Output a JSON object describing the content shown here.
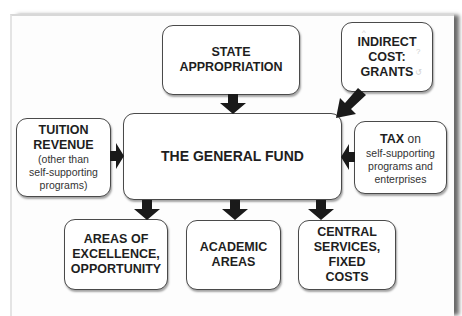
{
  "diagram": {
    "center": {
      "label": "THE GENERAL FUND"
    },
    "inputs": [
      {
        "id": "state",
        "lines": [
          "STATE",
          "APPROPRIATION"
        ]
      },
      {
        "id": "indirect",
        "lines": [
          "INDIRECT",
          "COST:",
          "GRANTS"
        ]
      },
      {
        "id": "tuition",
        "title_lines": [
          "TUITION",
          "REVENUE"
        ],
        "note_lines": [
          "(other than",
          "self-supporting",
          "programs)"
        ]
      },
      {
        "id": "tax",
        "title": "TAX",
        "title_suffix": " on",
        "note_lines": [
          "self-supporting",
          "programs and",
          "enterprises"
        ]
      }
    ],
    "outputs": [
      {
        "id": "excellence",
        "lines": [
          "AREAS OF",
          "EXCELLENCE,",
          "OPPORTUNITY"
        ]
      },
      {
        "id": "academic",
        "lines": [
          "ACADEMIC",
          "AREAS"
        ]
      },
      {
        "id": "central",
        "lines": [
          "CENTRAL",
          "SERVICES, FIXED",
          "COSTS"
        ]
      }
    ],
    "colors": {
      "arrow": "#1a1a1a",
      "border": "#4a4a4a",
      "text": "#1e1e1e"
    }
  }
}
